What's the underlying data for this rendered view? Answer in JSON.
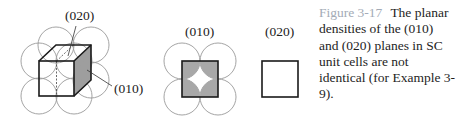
{
  "figure": {
    "number": "Figure 3-17",
    "caption": "The planar densities of the (010) and (020) planes in SC unit cells are not identical (for Example 3-9).",
    "colors": {
      "shaded_plane": "#b3b3b3",
      "atom_outline": "#9a9a9a",
      "cell_edge": "#1a1a1a",
      "figure_label": "#a3abb6"
    }
  },
  "panels": [
    {
      "id": "unit-cell-3d",
      "description": "Simple cubic unit cell with 8 corner atoms; (010) and (020) planes indicated",
      "callouts": [
        {
          "label": "(020)",
          "points_to": "mid-cell plane (dashed)"
        },
        {
          "label": "(010)",
          "points_to": "right face (shaded)"
        }
      ]
    },
    {
      "id": "plane-010",
      "title": "(010)",
      "description": "Square face with quarter-atom sections shaded at each corner"
    },
    {
      "id": "plane-020",
      "title": "(020)",
      "description": "Empty square — no atoms intersected"
    }
  ]
}
